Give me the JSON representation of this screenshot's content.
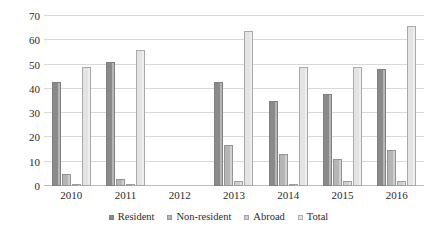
{
  "chart_data": {
    "type": "bar",
    "title": "",
    "subtitle": "",
    "xlabel": "",
    "ylabel": "",
    "grid": true,
    "legend_position": "bottom-center",
    "orientation": "vertical",
    "grouping": "grouped",
    "ylim": [
      0,
      70
    ],
    "ytick_step": 10,
    "ytick_labels": [
      "0",
      "10",
      "20",
      "30",
      "40",
      "50",
      "60",
      "70"
    ],
    "ytick_values": [
      0,
      10,
      20,
      30,
      40,
      50,
      60,
      70
    ],
    "categories": [
      "2010",
      "2011",
      "2012",
      "2013",
      "2014",
      "2015",
      "2016"
    ],
    "series": [
      {
        "name": "Resident",
        "color": "#8a8a8a",
        "values": [
          43,
          51,
          0,
          43,
          35,
          38,
          48
        ]
      },
      {
        "name": "Non-resident",
        "color": "#b5b5b5",
        "values": [
          5,
          3,
          0,
          17,
          13,
          11,
          15
        ]
      },
      {
        "name": "Abroad",
        "color": "#cfcfcf",
        "values": [
          1,
          1,
          0,
          2,
          1,
          2,
          2
        ]
      },
      {
        "name": "Total",
        "color": "#e4e4e4",
        "values": [
          49,
          56,
          0,
          64,
          49,
          49,
          66
        ]
      }
    ]
  }
}
